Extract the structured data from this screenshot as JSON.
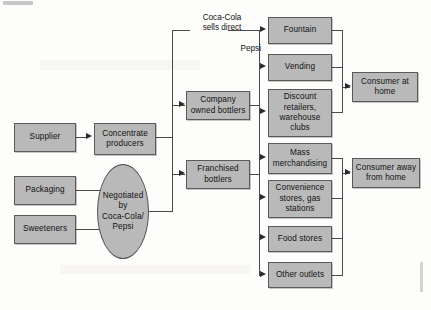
{
  "figure": {
    "kind": "value-chain-flow-diagram",
    "background_color": "#fdfdfc",
    "node_fill_color": "#b9b9b9",
    "node_border_color": "#5a5a5a",
    "connector_color": "#4a4a4a"
  },
  "inputs": [
    {
      "id": "supplier",
      "label": "Supplier"
    },
    {
      "id": "packaging",
      "label": "Packaging"
    },
    {
      "id": "sweeteners",
      "label": "Sweeteners"
    }
  ],
  "producers": {
    "concentrate": "Concentrate\nproducers",
    "negotiation_ellipse": "Negotiated\nby\nCoca-Cola/\nPepsi"
  },
  "bottlers": [
    {
      "id": "company-owned",
      "label": "Company\nowned bottlers"
    },
    {
      "id": "franchised",
      "label": "Franchised\nbottlers"
    }
  ],
  "edge_labels": {
    "coca_cola_direct": "Coca-Cola\nsells direct",
    "pepsi": "Pepsi"
  },
  "channels": [
    {
      "id": "fountain",
      "label": "Fountain"
    },
    {
      "id": "vending",
      "label": "Vending"
    },
    {
      "id": "discount",
      "label": "Discount\nretailers,\nwarehouse\nclubs"
    },
    {
      "id": "mass",
      "label": "Mass\nmerchandising"
    },
    {
      "id": "convenience",
      "label": "Convenience\nstores, gas\nstations"
    },
    {
      "id": "food-stores",
      "label": "Food stores"
    },
    {
      "id": "other",
      "label": "Other outlets"
    }
  ],
  "consumers": [
    {
      "id": "at-home",
      "label": "Consumer at\nhome"
    },
    {
      "id": "away-home",
      "label": "Consumer away\nfrom home"
    }
  ]
}
